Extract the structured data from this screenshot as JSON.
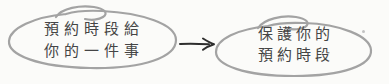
{
  "canvas": {
    "width": 389,
    "height": 84,
    "background_color": "#fbfbf9"
  },
  "diagram": {
    "text_color": "#454545",
    "bubble_stroke_color": "#a3a3a3",
    "arrow_color": "#2e2e2e",
    "left_bubble": {
      "line1": "預約時段給",
      "line2": "你的一件事"
    },
    "arrow": {
      "direction": "right",
      "icon": "arrow-right-icon"
    },
    "right_bubble": {
      "line1": "保護你的",
      "line2": "預約時段"
    }
  }
}
